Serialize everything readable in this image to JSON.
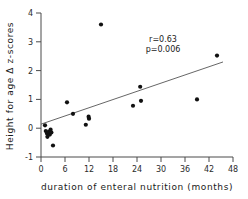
{
  "chart_data": {
    "type": "scatter",
    "title": "",
    "xlabel": "duration of enteral nutrition (months)",
    "ylabel": "Height for age Δ z-scores",
    "xlim": [
      0,
      48
    ],
    "ylim": [
      -1,
      4
    ],
    "xticks": [
      0,
      6,
      12,
      18,
      24,
      30,
      36,
      42,
      48
    ],
    "yticks": [
      -1,
      0,
      1,
      2,
      3,
      4
    ],
    "xtick_labels": [
      "0",
      "6",
      "12",
      "18",
      "24",
      "30",
      "36",
      "42",
      "48"
    ],
    "ytick_labels": [
      "-1",
      "0",
      "1",
      "2",
      "3",
      "4"
    ],
    "grid": false,
    "legend": false,
    "marker": "filled-circle",
    "marker_color": "#111111",
    "points": [
      {
        "x": 1.0,
        "y": 0.1
      },
      {
        "x": 1.2,
        "y": -0.1
      },
      {
        "x": 1.5,
        "y": -0.18
      },
      {
        "x": 1.6,
        "y": -0.3
      },
      {
        "x": 2.0,
        "y": -0.12
      },
      {
        "x": 2.2,
        "y": -0.22
      },
      {
        "x": 2.4,
        "y": -0.05
      },
      {
        "x": 2.6,
        "y": -0.15
      },
      {
        "x": 3.0,
        "y": -0.6
      },
      {
        "x": 6.5,
        "y": 0.9
      },
      {
        "x": 8.0,
        "y": 0.5
      },
      {
        "x": 11.2,
        "y": 0.12
      },
      {
        "x": 11.9,
        "y": 0.4
      },
      {
        "x": 12.0,
        "y": 0.33
      },
      {
        "x": 15.0,
        "y": 3.6
      },
      {
        "x": 23.0,
        "y": 0.78
      },
      {
        "x": 24.8,
        "y": 1.44
      },
      {
        "x": 25.0,
        "y": 0.95
      },
      {
        "x": 39.0,
        "y": 1.0
      },
      {
        "x": 44.0,
        "y": 2.52
      }
    ],
    "fit_line": {
      "x_start": 0.0,
      "y_start": 0.14,
      "x_end": 45.5,
      "y_end": 2.3
    },
    "annotations": [
      {
        "name": "correlation",
        "text": "r=0.63",
        "x": 30.5,
        "y": 3.0
      },
      {
        "name": "p-value",
        "text": "p=0.006",
        "x": 30.5,
        "y": 2.65
      }
    ]
  }
}
